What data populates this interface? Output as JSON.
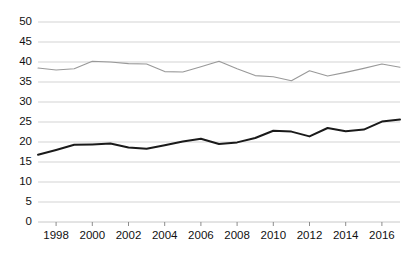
{
  "chart_data": {
    "type": "line",
    "title": "",
    "subtitle": "",
    "xlabel": "",
    "ylabel": "",
    "xlim": [
      1997,
      2017
    ],
    "ylim": [
      0,
      50
    ],
    "grid": true,
    "legend_position": "none",
    "y_ticks": [
      0,
      5,
      10,
      15,
      20,
      25,
      30,
      35,
      40,
      45,
      50
    ],
    "y_tick_labels": [
      "0",
      "5",
      "10",
      "15",
      "20",
      "25",
      "30",
      "35",
      "40",
      "45",
      "50"
    ],
    "x_ticks": [
      1998,
      2000,
      2002,
      2004,
      2006,
      2008,
      2010,
      2012,
      2014,
      2016
    ],
    "x_tick_labels": [
      "1998",
      "2000",
      "2002",
      "2004",
      "2006",
      "2008",
      "2010",
      "2012",
      "2014",
      "2016"
    ],
    "x": [
      1997,
      1998,
      1999,
      2000,
      2001,
      2002,
      2003,
      2004,
      2005,
      2006,
      2007,
      2008,
      2009,
      2010,
      2011,
      2012,
      2013,
      2014,
      2015,
      2016,
      2017
    ],
    "series": [
      {
        "name": "upper-series",
        "color": "#999999",
        "width": 1.1,
        "values": [
          38.5,
          38.0,
          38.3,
          40.2,
          40.0,
          39.6,
          39.5,
          37.6,
          37.5,
          38.8,
          40.2,
          38.3,
          36.6,
          36.3,
          35.3,
          37.8,
          36.5,
          37.4,
          38.4,
          39.5,
          38.7
        ]
      },
      {
        "name": "lower-series",
        "color": "#1a1a1a",
        "width": 2.0,
        "values": [
          16.8,
          18.0,
          19.3,
          19.4,
          19.6,
          18.6,
          18.3,
          19.2,
          20.1,
          20.8,
          19.5,
          19.9,
          21.0,
          22.8,
          22.6,
          21.4,
          23.5,
          22.7,
          23.1,
          25.1,
          25.6
        ]
      }
    ],
    "colors": {
      "gridline": "#c8c8c8",
      "axis": "#808080",
      "tick_text": "#111111",
      "background": "#ffffff",
      "series_upper": "#999999",
      "series_lower": "#1a1a1a"
    },
    "geometry": {
      "plot_left": 38,
      "plot_right": 400,
      "plot_top": 22,
      "plot_bottom": 222
    }
  }
}
